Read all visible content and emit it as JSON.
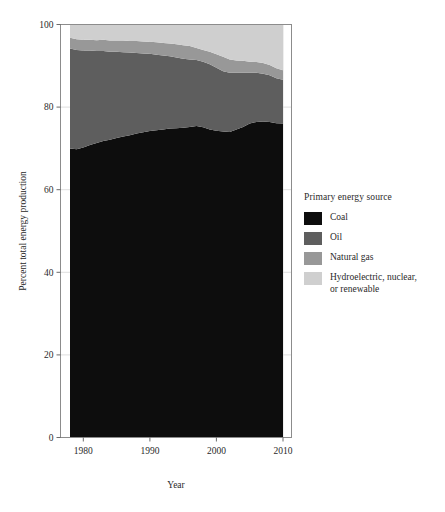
{
  "chart_data": {
    "type": "area",
    "title": "",
    "subtitle": "",
    "xlabel": "Year",
    "ylabel": "Percent total energy production",
    "xlim": [
      1978,
      2010
    ],
    "ylim": [
      0,
      100
    ],
    "xticks": [
      1980,
      1990,
      2000,
      2010
    ],
    "yticks": [
      0,
      20,
      40,
      60,
      80,
      100
    ],
    "grid": true,
    "stacked": true,
    "legend": {
      "title": "Primary energy source",
      "position": "right"
    },
    "x": [
      1978,
      1979,
      1980,
      1981,
      1982,
      1983,
      1984,
      1985,
      1986,
      1987,
      1988,
      1989,
      1990,
      1991,
      1992,
      1993,
      1994,
      1995,
      1996,
      1997,
      1998,
      1999,
      2000,
      2001,
      2002,
      2003,
      2004,
      2005,
      2006,
      2007,
      2008,
      2009,
      2010
    ],
    "series": [
      {
        "name": "Coal",
        "color": "#0d0d0d",
        "values": [
          70.0,
          69.8,
          70.2,
          70.8,
          71.3,
          71.8,
          72.1,
          72.5,
          72.9,
          73.2,
          73.6,
          73.9,
          74.2,
          74.4,
          74.6,
          74.8,
          74.9,
          75.0,
          75.2,
          75.4,
          75.1,
          74.6,
          74.3,
          74.1,
          74.0,
          74.6,
          75.2,
          76.0,
          76.4,
          76.5,
          76.4,
          76.1,
          76.0
        ]
      },
      {
        "name": "Oil",
        "color": "#5e5e5e",
        "values": [
          24.2,
          24.0,
          23.5,
          22.9,
          22.3,
          21.8,
          21.3,
          20.9,
          20.4,
          20.0,
          19.5,
          19.1,
          18.7,
          18.3,
          17.9,
          17.5,
          17.1,
          16.7,
          16.3,
          16.0,
          15.9,
          15.8,
          15.2,
          14.6,
          14.3,
          13.7,
          13.1,
          12.3,
          11.9,
          11.6,
          11.3,
          10.9,
          10.6
        ]
      },
      {
        "name": "Natural gas",
        "color": "#989898",
        "values": [
          2.6,
          2.6,
          2.6,
          2.6,
          2.6,
          2.7,
          2.7,
          2.7,
          2.8,
          2.8,
          2.9,
          2.9,
          2.9,
          3.0,
          3.0,
          3.1,
          3.2,
          3.3,
          3.3,
          2.9,
          2.8,
          3.0,
          3.3,
          3.5,
          3.2,
          3.0,
          2.9,
          2.7,
          2.6,
          2.6,
          2.5,
          2.4,
          2.3
        ]
      },
      {
        "name": "Hydroelectric, nuclear,\nor renewable",
        "color": "#cfcfcf",
        "values": [
          3.2,
          3.6,
          3.7,
          3.7,
          3.8,
          3.7,
          3.9,
          3.9,
          3.9,
          4.0,
          4.0,
          4.1,
          4.2,
          4.3,
          4.5,
          4.6,
          4.8,
          5.0,
          5.2,
          5.7,
          6.2,
          6.6,
          7.2,
          7.8,
          8.5,
          8.7,
          8.8,
          9.0,
          9.1,
          9.3,
          9.8,
          10.6,
          11.1
        ]
      }
    ]
  },
  "axes": {
    "ylabel": "Percent total energy production",
    "xlabel": "Year",
    "ytick_labels": [
      "0",
      "20",
      "40",
      "60",
      "80",
      "100"
    ],
    "xtick_labels": [
      "1980",
      "1990",
      "2000",
      "2010"
    ]
  },
  "legend": {
    "title": "Primary energy source",
    "items": [
      {
        "label": "Coal",
        "color": "#0d0d0d"
      },
      {
        "label": "Oil",
        "color": "#5e5e5e"
      },
      {
        "label": "Natural gas",
        "color": "#989898"
      },
      {
        "label": "Hydroelectric, nuclear,\nor renewable",
        "color": "#cfcfcf"
      }
    ]
  }
}
